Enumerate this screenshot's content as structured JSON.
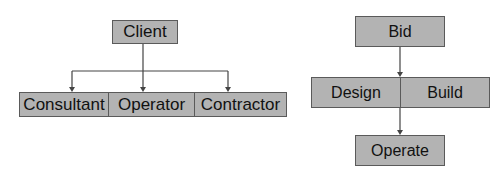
{
  "diagrams": [
    {
      "name": "organization-structure",
      "root": {
        "label": "Client"
      },
      "children": [
        {
          "label": "Consultant"
        },
        {
          "label": "Operator"
        },
        {
          "label": "Contractor"
        }
      ]
    },
    {
      "name": "project-delivery-flow",
      "top": {
        "label": "Bid"
      },
      "middle": [
        {
          "label": "Design"
        },
        {
          "label": "Build"
        }
      ],
      "bottom": {
        "label": "Operate"
      }
    }
  ],
  "colors": {
    "box_fill": "#b3b3b3",
    "box_border": "#5a5a5a",
    "line": "#444444",
    "text": "#111111"
  }
}
